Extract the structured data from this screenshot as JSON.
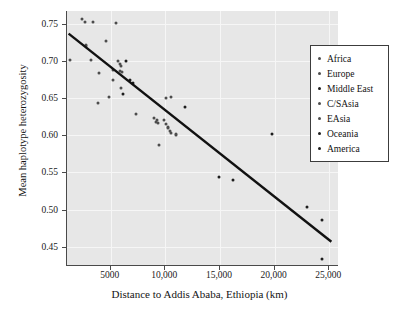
{
  "chart_data": {
    "type": "scatter",
    "title": "",
    "xlabel": "Distance to Addis Ababa, Ethiopia (km)",
    "ylabel": "Mean haplotype heterozygosity",
    "xlim": [
      1000,
      25800
    ],
    "ylim": [
      0.425,
      0.768
    ],
    "xticks": [
      5000,
      10000,
      15000,
      20000,
      25000
    ],
    "xticklabels": [
      "5000",
      "10,000",
      "15,000",
      "20,000",
      "25,000"
    ],
    "yticks": [
      0.45,
      0.5,
      0.55,
      0.6,
      0.65,
      0.7,
      0.75
    ],
    "yticklabels": [
      "0.45",
      "0.50",
      "0.55",
      "0.60",
      "0.65",
      "0.70",
      "0.75"
    ],
    "grid": true,
    "legend_position": "right",
    "legend": [
      "Africa",
      "Europe",
      "Middle East",
      "C/SAsia",
      "EAsia",
      "Oceania",
      "America"
    ],
    "trendline": {
      "x": [
        1150,
        25200
      ],
      "y": [
        0.7375,
        0.4565
      ]
    },
    "series": [
      {
        "name": "Africa",
        "points": [
          {
            "x": 1300,
            "y": 0.7015
          },
          {
            "x": 2700,
            "y": 0.7225
          },
          {
            "x": 2750,
            "y": 0.7205
          },
          {
            "x": 3150,
            "y": 0.7025
          },
          {
            "x": 2400,
            "y": 0.7575
          },
          {
            "x": 2650,
            "y": 0.7535
          },
          {
            "x": 3400,
            "y": 0.7535
          },
          {
            "x": 3900,
            "y": 0.6845
          },
          {
            "x": 3850,
            "y": 0.6435
          }
        ]
      },
      {
        "name": "Europe",
        "points": [
          {
            "x": 5500,
            "y": 0.7525
          },
          {
            "x": 4600,
            "y": 0.7275
          },
          {
            "x": 5200,
            "y": 0.6755
          },
          {
            "x": 5250,
            "y": 0.6885
          },
          {
            "x": 4850,
            "y": 0.6525
          },
          {
            "x": 5700,
            "y": 0.7005
          },
          {
            "x": 5800,
            "y": 0.6965
          },
          {
            "x": 5950,
            "y": 0.6935
          },
          {
            "x": 5850,
            "y": 0.6865
          },
          {
            "x": 6050,
            "y": 0.6855
          },
          {
            "x": 5900,
            "y": 0.6645
          }
        ]
      },
      {
        "name": "Middle East",
        "points": [
          {
            "x": 6400,
            "y": 0.7005
          },
          {
            "x": 6150,
            "y": 0.6555
          },
          {
            "x": 7000,
            "y": 0.6715
          },
          {
            "x": 6750,
            "y": 0.6745
          }
        ]
      },
      {
        "name": "C/SAsia",
        "points": [
          {
            "x": 7350,
            "y": 0.6295
          },
          {
            "x": 9000,
            "y": 0.6235
          },
          {
            "x": 9150,
            "y": 0.6185
          },
          {
            "x": 9300,
            "y": 0.6165
          },
          {
            "x": 9250,
            "y": 0.6205
          },
          {
            "x": 9900,
            "y": 0.6205
          },
          {
            "x": 10050,
            "y": 0.6155
          },
          {
            "x": 10200,
            "y": 0.6115
          }
        ]
      },
      {
        "name": "EAsia",
        "points": [
          {
            "x": 10250,
            "y": 0.6095
          },
          {
            "x": 10400,
            "y": 0.6065
          },
          {
            "x": 10500,
            "y": 0.6035
          },
          {
            "x": 10950,
            "y": 0.6005
          },
          {
            "x": 11000,
            "y": 0.6015
          },
          {
            "x": 9400,
            "y": 0.5875
          },
          {
            "x": 10100,
            "y": 0.6505
          },
          {
            "x": 10550,
            "y": 0.6515
          }
        ]
      },
      {
        "name": "Oceania",
        "points": [
          {
            "x": 11800,
            "y": 0.6385
          },
          {
            "x": 14900,
            "y": 0.5445
          },
          {
            "x": 16200,
            "y": 0.5405
          },
          {
            "x": 19800,
            "y": 0.6025
          }
        ]
      },
      {
        "name": "America",
        "points": [
          {
            "x": 22950,
            "y": 0.5035
          },
          {
            "x": 24300,
            "y": 0.4855
          },
          {
            "x": 24350,
            "y": 0.4325
          }
        ]
      }
    ]
  }
}
